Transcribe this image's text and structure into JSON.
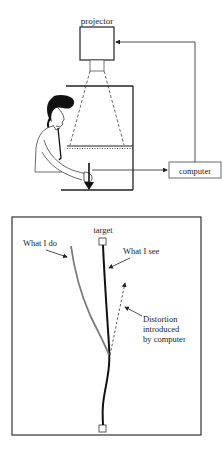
{
  "top_panel": {
    "projector_label": "projector",
    "computer_label": "computer"
  },
  "bottom_panel": {
    "target_label": "target",
    "what_i_do_label": "What I do",
    "what_i_see_label": "What I see",
    "distortion_label_line1": "Distortion",
    "distortion_label_line2": "introduced",
    "distortion_label_line3": "by computer"
  },
  "colors": {
    "stroke": "#222222",
    "what_i_do_line": "#7a7a7a",
    "what_i_see_line": "#111111"
  }
}
